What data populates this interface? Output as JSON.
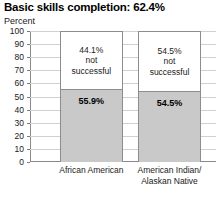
{
  "chart_data": {
    "type": "bar",
    "title": "Basic skills completion: 62.4%",
    "ylabel": "Percent",
    "xlabel": "",
    "ylim": [
      0,
      100
    ],
    "grid": true,
    "legend": "none",
    "stacked": true,
    "categories": [
      "African American",
      "American Indian/\nAlaskan Native"
    ],
    "tick_labels": [
      "100",
      "90",
      "80",
      "70",
      "60",
      "50",
      "40",
      "30",
      "20",
      "10",
      "0"
    ],
    "tick_values": [
      100,
      90,
      80,
      70,
      60,
      50,
      40,
      30,
      20,
      10,
      0
    ],
    "series": [
      {
        "name": "successful",
        "values": [
          55.9,
          54.5
        ],
        "labels": [
          "55.9%",
          "54.5%"
        ],
        "color": "#c9c9c9"
      },
      {
        "name": "not successful",
        "values": [
          44.1,
          54.5
        ],
        "labels": [
          "44.1%\nnot\nsuccessful",
          "54.5%\nnot\nsuccessful"
        ],
        "color": "#ffffff"
      }
    ]
  }
}
